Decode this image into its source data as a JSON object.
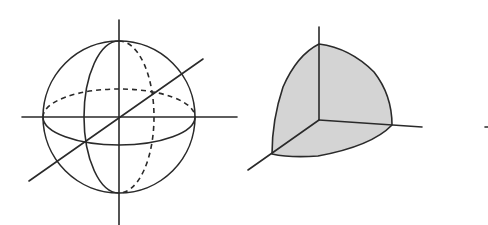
{
  "figure": {
    "panels": [
      {
        "id": "sphere",
        "label": "Sphere with 3D axes, equator and meridian circles (hidden edges dashed)"
      },
      {
        "id": "octant",
        "label": "Spherical octant shaded gray with 3D axes",
        "fill_color": "#d4d4d4"
      }
    ],
    "colors": {
      "line": "#2a2a2a",
      "fill": "#d4d4d4",
      "background": "#ffffff"
    }
  }
}
